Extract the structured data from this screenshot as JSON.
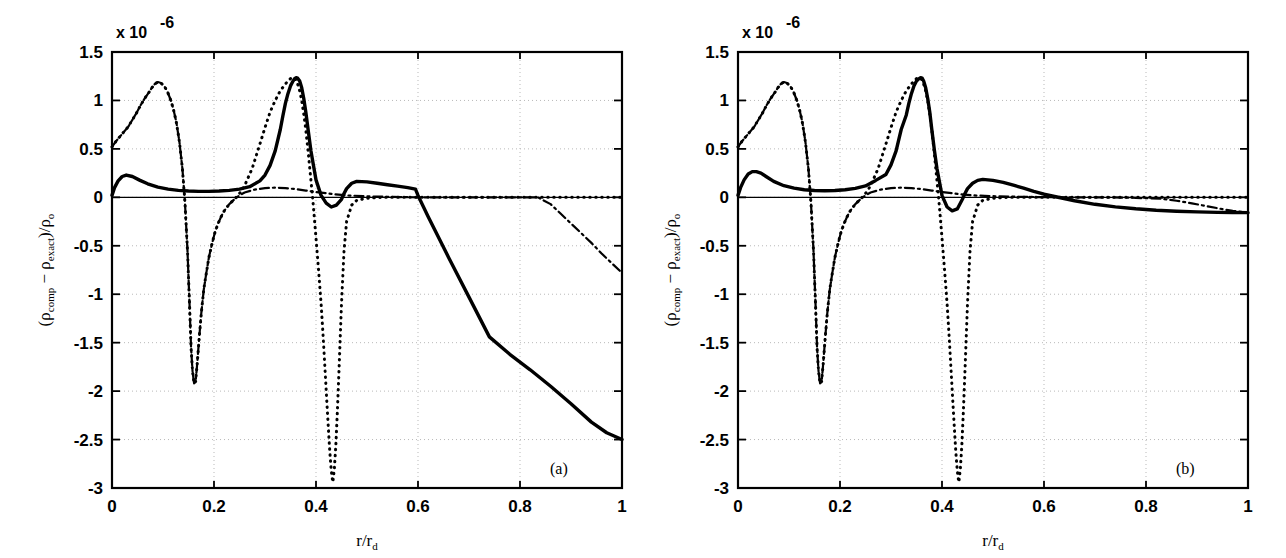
{
  "figure": {
    "background": "#ffffff",
    "line_color": "#000000",
    "grid_color": "#b9b9b9"
  },
  "chart_data": [
    {
      "type": "line",
      "panel_tag": "(a)",
      "title": "",
      "xlabel": "r/r_d",
      "ylabel": "(ρ_comp − ρ_exact)/ρ_o",
      "y_exponent_label": "x 10",
      "y_exponent_power": "-6",
      "xlim": [
        0,
        1
      ],
      "ylim": [
        -3,
        1.5
      ],
      "xticks": [
        0,
        0.2,
        0.4,
        0.6,
        0.8,
        1
      ],
      "xticklabels": [
        "0",
        "0.2",
        "0.4",
        "0.6",
        "0.8",
        "1"
      ],
      "yticks": [
        -3,
        -2.5,
        -2,
        -1.5,
        -1,
        -0.5,
        0,
        0.5,
        1,
        1.5
      ],
      "yticklabels": [
        "-3",
        "-2.5",
        "-2",
        "-1.5",
        "-1",
        "-0.5",
        "0",
        "0.5",
        "1",
        "1.5"
      ],
      "grid": true,
      "legend": "none",
      "series": [
        {
          "name": "solid",
          "style": "solid",
          "x": [
            0.0,
            0.005,
            0.012,
            0.02,
            0.028,
            0.04,
            0.055,
            0.07,
            0.09,
            0.11,
            0.13,
            0.15,
            0.17,
            0.19,
            0.21,
            0.23,
            0.25,
            0.27,
            0.29,
            0.3,
            0.31,
            0.32,
            0.33,
            0.335,
            0.34,
            0.345,
            0.35,
            0.355,
            0.358,
            0.361,
            0.364,
            0.368,
            0.372,
            0.376,
            0.38,
            0.385,
            0.39,
            0.4,
            0.41,
            0.42,
            0.43,
            0.44,
            0.45,
            0.455,
            0.46,
            0.47,
            0.48,
            0.5,
            0.52,
            0.54,
            0.56,
            0.58,
            0.595,
            0.6,
            0.62,
            0.66,
            0.7,
            0.74,
            0.78,
            0.82,
            0.86,
            0.9,
            0.94,
            0.97,
            1.0
          ],
          "y": [
            0.02,
            0.1,
            0.17,
            0.215,
            0.23,
            0.215,
            0.175,
            0.14,
            0.105,
            0.085,
            0.072,
            0.065,
            0.062,
            0.062,
            0.065,
            0.072,
            0.085,
            0.11,
            0.17,
            0.23,
            0.33,
            0.48,
            0.7,
            0.84,
            0.97,
            1.07,
            1.15,
            1.2,
            1.225,
            1.235,
            1.23,
            1.2,
            1.13,
            1.02,
            0.88,
            0.68,
            0.48,
            0.18,
            0.02,
            -0.06,
            -0.1,
            -0.08,
            -0.02,
            0.04,
            0.09,
            0.145,
            0.165,
            0.16,
            0.145,
            0.13,
            0.115,
            0.1,
            0.085,
            0.02,
            -0.2,
            -0.62,
            -1.03,
            -1.44,
            -1.62,
            -1.78,
            -1.95,
            -2.13,
            -2.32,
            -2.43,
            -2.5
          ]
        },
        {
          "name": "dashdot",
          "style": "dashdot",
          "x": [
            0.0,
            0.008,
            0.016,
            0.024,
            0.032,
            0.04,
            0.048,
            0.056,
            0.064,
            0.072,
            0.078,
            0.084,
            0.09,
            0.096,
            0.102,
            0.108,
            0.114,
            0.12,
            0.126,
            0.132,
            0.138,
            0.143,
            0.148,
            0.152,
            0.155,
            0.158,
            0.161,
            0.164,
            0.167,
            0.171,
            0.175,
            0.18,
            0.185,
            0.19,
            0.196,
            0.202,
            0.208,
            0.214,
            0.22,
            0.23,
            0.24,
            0.25,
            0.26,
            0.28,
            0.3,
            0.32,
            0.34,
            0.36,
            0.38,
            0.4,
            0.43,
            0.46,
            0.5,
            0.55,
            0.6,
            0.66,
            0.72,
            0.78,
            0.835,
            0.86,
            0.88,
            0.9,
            0.92,
            0.94,
            0.96,
            0.98,
            1.0
          ],
          "y": [
            0.52,
            0.58,
            0.63,
            0.68,
            0.73,
            0.8,
            0.87,
            0.95,
            1.02,
            1.08,
            1.13,
            1.17,
            1.19,
            1.18,
            1.15,
            1.1,
            1.02,
            0.92,
            0.78,
            0.58,
            0.3,
            -0.05,
            -0.55,
            -1.1,
            -1.55,
            -1.8,
            -1.92,
            -1.9,
            -1.72,
            -1.45,
            -1.2,
            -0.95,
            -0.78,
            -0.62,
            -0.48,
            -0.36,
            -0.27,
            -0.2,
            -0.14,
            -0.07,
            -0.02,
            0.02,
            0.05,
            0.08,
            0.095,
            0.1,
            0.095,
            0.085,
            0.07,
            0.055,
            0.035,
            0.02,
            0.01,
            0.004,
            0.0,
            0.0,
            0.0,
            0.0,
            0.0,
            -0.07,
            -0.17,
            -0.27,
            -0.37,
            -0.47,
            -0.58,
            -0.68,
            -0.78
          ]
        },
        {
          "name": "dotted",
          "style": "dotted",
          "x": [
            0.0,
            0.008,
            0.016,
            0.024,
            0.032,
            0.04,
            0.048,
            0.056,
            0.064,
            0.072,
            0.078,
            0.084,
            0.09,
            0.096,
            0.102,
            0.108,
            0.114,
            0.12,
            0.126,
            0.132,
            0.138,
            0.143,
            0.148,
            0.152,
            0.155,
            0.158,
            0.161,
            0.164,
            0.167,
            0.171,
            0.175,
            0.18,
            0.185,
            0.19,
            0.196,
            0.202,
            0.208,
            0.214,
            0.22,
            0.23,
            0.24,
            0.25,
            0.26,
            0.275,
            0.29,
            0.3,
            0.31,
            0.32,
            0.33,
            0.34,
            0.345,
            0.35,
            0.355,
            0.358,
            0.361,
            0.364,
            0.368,
            0.372,
            0.376,
            0.38,
            0.385,
            0.39,
            0.395,
            0.4,
            0.405,
            0.41,
            0.413,
            0.416,
            0.419,
            0.422,
            0.425,
            0.427,
            0.429,
            0.431,
            0.433,
            0.436,
            0.439,
            0.442,
            0.445,
            0.45,
            0.455,
            0.46,
            0.47,
            0.48,
            0.5,
            0.53,
            0.57,
            0.62,
            0.68,
            0.75,
            0.82,
            0.9,
            1.0
          ],
          "y": [
            0.52,
            0.58,
            0.63,
            0.68,
            0.73,
            0.8,
            0.87,
            0.95,
            1.02,
            1.08,
            1.13,
            1.17,
            1.19,
            1.18,
            1.15,
            1.1,
            1.02,
            0.92,
            0.78,
            0.58,
            0.3,
            -0.05,
            -0.55,
            -1.1,
            -1.55,
            -1.8,
            -1.92,
            -1.9,
            -1.72,
            -1.45,
            -1.2,
            -0.95,
            -0.78,
            -0.62,
            -0.48,
            -0.36,
            -0.27,
            -0.2,
            -0.14,
            -0.07,
            -0.02,
            0.04,
            0.12,
            0.3,
            0.55,
            0.72,
            0.88,
            1.0,
            1.1,
            1.17,
            1.2,
            1.225,
            1.235,
            1.23,
            1.21,
            1.17,
            1.1,
            1.0,
            0.86,
            0.7,
            0.45,
            0.18,
            -0.1,
            -0.42,
            -0.75,
            -1.1,
            -1.35,
            -1.62,
            -1.9,
            -2.18,
            -2.45,
            -2.62,
            -2.76,
            -2.87,
            -2.94,
            -2.8,
            -2.55,
            -2.2,
            -1.8,
            -1.1,
            -0.55,
            -0.25,
            -0.08,
            -0.03,
            -0.01,
            0.0,
            0.0,
            0.0,
            0.0,
            0.0,
            0.0,
            0.0,
            0.0
          ]
        }
      ]
    },
    {
      "type": "line",
      "panel_tag": "(b)",
      "title": "",
      "xlabel": "r/r_d",
      "ylabel": "(ρ_comp − ρ_exact)/ρ_o",
      "y_exponent_label": "x 10",
      "y_exponent_power": "-6",
      "xlim": [
        0,
        1
      ],
      "ylim": [
        -3,
        1.5
      ],
      "xticks": [
        0,
        0.2,
        0.4,
        0.6,
        0.8,
        1
      ],
      "xticklabels": [
        "0",
        "0.2",
        "0.4",
        "0.6",
        "0.8",
        "1"
      ],
      "yticks": [
        -3,
        -2.5,
        -2,
        -1.5,
        -1,
        -0.5,
        0,
        0.5,
        1,
        1.5
      ],
      "yticklabels": [
        "-3",
        "-2.5",
        "-2",
        "-1.5",
        "-1",
        "-0.5",
        "0",
        "0.5",
        "1",
        "1.5"
      ],
      "grid": true,
      "legend": "none",
      "series": [
        {
          "name": "solid",
          "style": "solid",
          "x": [
            0.0,
            0.005,
            0.012,
            0.02,
            0.028,
            0.036,
            0.045,
            0.055,
            0.07,
            0.09,
            0.11,
            0.13,
            0.15,
            0.17,
            0.19,
            0.21,
            0.23,
            0.25,
            0.27,
            0.29,
            0.3,
            0.31,
            0.32,
            0.33,
            0.335,
            0.34,
            0.345,
            0.35,
            0.355,
            0.358,
            0.361,
            0.364,
            0.368,
            0.372,
            0.376,
            0.38,
            0.385,
            0.39,
            0.4,
            0.41,
            0.42,
            0.43,
            0.44,
            0.445,
            0.45,
            0.46,
            0.47,
            0.48,
            0.5,
            0.52,
            0.54,
            0.56,
            0.58,
            0.6,
            0.63,
            0.66,
            0.7,
            0.74,
            0.78,
            0.82,
            0.86,
            0.9,
            0.94,
            0.97,
            1.0
          ],
          "y": [
            0.02,
            0.1,
            0.18,
            0.24,
            0.265,
            0.265,
            0.25,
            0.215,
            0.165,
            0.12,
            0.095,
            0.078,
            0.07,
            0.068,
            0.07,
            0.078,
            0.092,
            0.118,
            0.175,
            0.235,
            0.335,
            0.48,
            0.7,
            0.85,
            0.97,
            1.07,
            1.15,
            1.2,
            1.225,
            1.235,
            1.23,
            1.2,
            1.13,
            1.02,
            0.88,
            0.7,
            0.49,
            0.3,
            0.02,
            -0.1,
            -0.14,
            -0.12,
            -0.02,
            0.04,
            0.09,
            0.145,
            0.175,
            0.185,
            0.175,
            0.155,
            0.125,
            0.095,
            0.062,
            0.032,
            -0.002,
            -0.035,
            -0.072,
            -0.098,
            -0.118,
            -0.133,
            -0.143,
            -0.15,
            -0.155,
            -0.157,
            -0.158
          ]
        },
        {
          "name": "dashdot",
          "style": "dashdot",
          "x": [
            0.0,
            0.008,
            0.016,
            0.024,
            0.032,
            0.04,
            0.048,
            0.056,
            0.064,
            0.072,
            0.078,
            0.084,
            0.09,
            0.096,
            0.102,
            0.108,
            0.114,
            0.12,
            0.126,
            0.132,
            0.138,
            0.143,
            0.148,
            0.152,
            0.155,
            0.158,
            0.161,
            0.164,
            0.167,
            0.171,
            0.175,
            0.18,
            0.185,
            0.19,
            0.196,
            0.202,
            0.208,
            0.214,
            0.22,
            0.23,
            0.24,
            0.25,
            0.26,
            0.28,
            0.3,
            0.32,
            0.34,
            0.36,
            0.38,
            0.4,
            0.43,
            0.46,
            0.5,
            0.55,
            0.6,
            0.66,
            0.72,
            0.78,
            0.83,
            0.86,
            0.89,
            0.92,
            0.95,
            0.97,
            0.99,
            1.0
          ],
          "y": [
            0.52,
            0.58,
            0.63,
            0.68,
            0.73,
            0.8,
            0.87,
            0.95,
            1.02,
            1.08,
            1.13,
            1.17,
            1.19,
            1.18,
            1.15,
            1.1,
            1.02,
            0.92,
            0.78,
            0.58,
            0.3,
            -0.05,
            -0.55,
            -1.1,
            -1.55,
            -1.8,
            -1.92,
            -1.9,
            -1.72,
            -1.45,
            -1.2,
            -0.95,
            -0.78,
            -0.62,
            -0.48,
            -0.36,
            -0.27,
            -0.2,
            -0.14,
            -0.07,
            -0.02,
            0.02,
            0.05,
            0.08,
            0.095,
            0.1,
            0.095,
            0.085,
            0.07,
            0.055,
            0.035,
            0.02,
            0.012,
            0.006,
            0.002,
            0.0,
            0.0,
            -0.005,
            -0.015,
            -0.035,
            -0.062,
            -0.092,
            -0.122,
            -0.14,
            -0.152,
            -0.157
          ]
        },
        {
          "name": "dotted",
          "style": "dotted",
          "x": [
            0.0,
            0.008,
            0.016,
            0.024,
            0.032,
            0.04,
            0.048,
            0.056,
            0.064,
            0.072,
            0.078,
            0.084,
            0.09,
            0.096,
            0.102,
            0.108,
            0.114,
            0.12,
            0.126,
            0.132,
            0.138,
            0.143,
            0.148,
            0.152,
            0.155,
            0.158,
            0.161,
            0.164,
            0.167,
            0.171,
            0.175,
            0.18,
            0.185,
            0.19,
            0.196,
            0.202,
            0.208,
            0.214,
            0.22,
            0.23,
            0.24,
            0.25,
            0.26,
            0.275,
            0.29,
            0.3,
            0.31,
            0.32,
            0.33,
            0.34,
            0.345,
            0.35,
            0.355,
            0.358,
            0.361,
            0.364,
            0.368,
            0.372,
            0.376,
            0.38,
            0.385,
            0.39,
            0.395,
            0.4,
            0.405,
            0.41,
            0.413,
            0.416,
            0.419,
            0.422,
            0.425,
            0.427,
            0.429,
            0.431,
            0.433,
            0.436,
            0.439,
            0.442,
            0.445,
            0.45,
            0.455,
            0.46,
            0.47,
            0.48,
            0.5,
            0.53,
            0.57,
            0.62,
            0.68,
            0.75,
            0.82,
            0.9,
            1.0
          ],
          "y": [
            0.52,
            0.58,
            0.63,
            0.68,
            0.73,
            0.8,
            0.87,
            0.95,
            1.02,
            1.08,
            1.13,
            1.17,
            1.19,
            1.18,
            1.15,
            1.1,
            1.02,
            0.92,
            0.78,
            0.58,
            0.3,
            -0.05,
            -0.55,
            -1.1,
            -1.55,
            -1.8,
            -1.92,
            -1.9,
            -1.72,
            -1.45,
            -1.2,
            -0.95,
            -0.78,
            -0.62,
            -0.48,
            -0.36,
            -0.27,
            -0.2,
            -0.14,
            -0.07,
            -0.02,
            0.04,
            0.12,
            0.3,
            0.55,
            0.72,
            0.88,
            1.0,
            1.1,
            1.17,
            1.2,
            1.225,
            1.235,
            1.23,
            1.21,
            1.17,
            1.1,
            1.0,
            0.86,
            0.7,
            0.45,
            0.18,
            -0.1,
            -0.42,
            -0.75,
            -1.1,
            -1.35,
            -1.62,
            -1.9,
            -2.18,
            -2.45,
            -2.62,
            -2.76,
            -2.87,
            -2.94,
            -2.8,
            -2.55,
            -2.2,
            -1.8,
            -1.1,
            -0.55,
            -0.25,
            -0.08,
            -0.03,
            -0.01,
            0.0,
            0.0,
            0.0,
            0.0,
            0.0,
            0.0,
            0.0,
            0.0
          ]
        }
      ]
    }
  ],
  "axis_label_parts": {
    "rho": "ρ",
    "comp": "comp",
    "minus": "−",
    "exact": "exact",
    "slash": ")/",
    "open": "(",
    "o": "o",
    "r": "r",
    "d": "d"
  }
}
